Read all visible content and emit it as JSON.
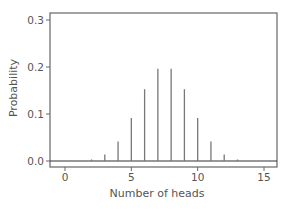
{
  "chart_data": {
    "type": "bar",
    "title": "",
    "xlabel": "Number of heads",
    "ylabel": "Probability",
    "x": [
      0,
      1,
      2,
      3,
      4,
      5,
      6,
      7,
      8,
      9,
      10,
      11,
      12,
      13,
      14,
      15
    ],
    "values": [
      3e-05,
      0.0005,
      0.0032,
      0.0139,
      0.0417,
      0.0916,
      0.1527,
      0.1964,
      0.1964,
      0.1527,
      0.0916,
      0.0417,
      0.0139,
      0.0032,
      0.0005,
      3e-05
    ],
    "xlim": [
      -0.6,
      16.8
    ],
    "ylim": [
      -0.013,
      0.315
    ],
    "xticks": [
      0,
      5,
      10,
      15
    ],
    "xtick_labels": [
      "0",
      "5",
      "10",
      "15"
    ],
    "yticks": [
      0.0,
      0.1,
      0.2,
      0.3
    ],
    "ytick_labels": [
      "0.0",
      "0.1",
      "0.2",
      "0.3"
    ],
    "grid": false,
    "legend": null,
    "style": "spike plot"
  },
  "colors": {
    "axis": "#666666",
    "spike": "#777777",
    "text": "#555555"
  }
}
